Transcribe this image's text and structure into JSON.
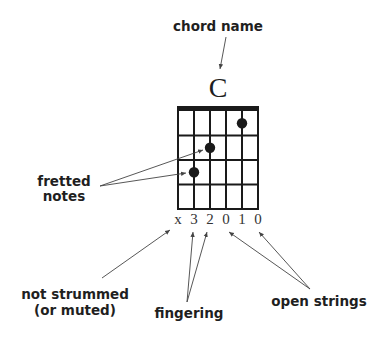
{
  "chord": {
    "name": "C",
    "strings": 6,
    "frets": 4,
    "dots": [
      {
        "string": 5,
        "fret": 3
      },
      {
        "string": 4,
        "fret": 2
      },
      {
        "string": 2,
        "fret": 1
      }
    ],
    "fingering": [
      "x",
      "3",
      "2",
      "0",
      "1",
      "0"
    ]
  },
  "labels": {
    "chord_name": "chord name",
    "fretted_notes_line1": "fretted",
    "fretted_notes_line2": "notes",
    "not_strummed_line1": "not strummed",
    "not_strummed_line2": "(or muted)",
    "fingering": "fingering",
    "open_strings": "open strings"
  },
  "colors": {
    "ink": "#1a1a1a",
    "arrow": "#444444",
    "background": "#ffffff"
  }
}
